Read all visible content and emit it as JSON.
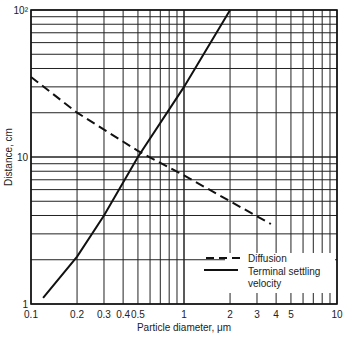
{
  "chart_data": {
    "type": "line",
    "title": "",
    "xlabel": "Particle diameter, μm",
    "ylabel": "Distance, cm",
    "xscale": "log",
    "yscale": "log",
    "xlim": [
      0.1,
      10
    ],
    "ylim": [
      1,
      100
    ],
    "grid": true,
    "x_tick_labels": [
      "0.1",
      "0.2",
      "0.3",
      "0.4",
      "0.5",
      "1",
      "2",
      "3",
      "4",
      "5",
      "10"
    ],
    "x_tick_values": [
      0.1,
      0.2,
      0.3,
      0.4,
      0.5,
      1,
      2,
      3,
      4,
      5,
      10
    ],
    "y_tick_labels": [
      "1",
      "10",
      "10²"
    ],
    "y_tick_values": [
      1,
      10,
      100
    ],
    "legend_position": "lower right",
    "series": [
      {
        "name": "Diffusion",
        "style": "dashed",
        "x": [
          0.1,
          0.2,
          0.5,
          1,
          2,
          3.7
        ],
        "y": [
          35,
          20,
          11,
          7.5,
          5,
          3.5
        ]
      },
      {
        "name": "Terminal settling velocity",
        "style": "solid",
        "x": [
          0.12,
          0.2,
          0.3,
          0.5,
          1,
          2
        ],
        "y": [
          1.1,
          2.1,
          4,
          10,
          30,
          100
        ]
      }
    ]
  },
  "legend": {
    "diffusion": "Diffusion",
    "settling_line1": "Terminal settling",
    "settling_line2": "velocity"
  },
  "axes": {
    "xlabel": "Particle diameter, μm",
    "ylabel": "Distance, cm"
  }
}
